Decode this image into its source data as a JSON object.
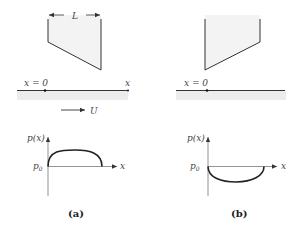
{
  "panels": [
    {
      "id": "a",
      "caption": "(a)",
      "wedge": {
        "length_label": "L",
        "orientation": "diverging"
      },
      "wall": {
        "origin_label": "x = 0",
        "axis_label": "x",
        "velocity_label": "U"
      },
      "graph": {
        "y_label": "p(x)",
        "baseline_label": "p0",
        "x_label": "x",
        "curve": "positive-arch"
      }
    },
    {
      "id": "b",
      "caption": "(b)",
      "wedge": {
        "length_label": "",
        "orientation": "converging"
      },
      "wall": {
        "origin_label": "x = 0",
        "axis_label": "",
        "velocity_label": ""
      },
      "graph": {
        "y_label": "p(x)",
        "baseline_label": "p0",
        "x_label": "x",
        "curve": "negative-arch"
      }
    }
  ],
  "colors": {
    "line": "#333333",
    "fill": "#f2f2f2",
    "band": "#ececec"
  }
}
